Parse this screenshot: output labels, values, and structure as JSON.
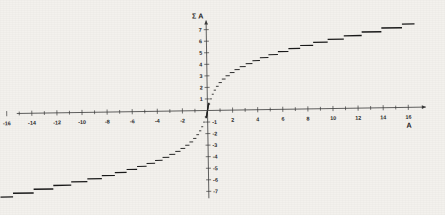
{
  "figure": {
    "background_color": "#f3f1ed",
    "axis_color": "#3a3a3a",
    "data_color": "#1a1a1a",
    "rotation_deg": -0.9
  },
  "chart_data": {
    "type": "line",
    "title": "",
    "subtitle": "",
    "xlabel": "A",
    "ylabel": "Σ A",
    "style": "dashed-step-segments",
    "grid": false,
    "legend": null,
    "xlim": [
      -17,
      17
    ],
    "ylim": [
      -7.9,
      7.9
    ],
    "xticks_major": [
      -16,
      -14,
      -12,
      -10,
      -8,
      -6,
      -4,
      -2,
      2,
      4,
      6,
      8,
      10,
      12,
      14,
      16
    ],
    "xtick_labels": [
      "-16",
      "-14",
      "-12",
      "-10",
      "-8",
      "-6",
      "-4",
      "-2",
      "2",
      "4",
      "6",
      "8",
      "10",
      "12",
      "14",
      "16"
    ],
    "xtick_step_minor": 1,
    "yticks_major": [
      7,
      6,
      5,
      4,
      3,
      2,
      1,
      -1,
      -2,
      -3,
      -4,
      -5,
      -6,
      -7
    ],
    "ytick_labels": [
      "7",
      "6",
      "5",
      "4",
      "3",
      "2",
      "1",
      "-1",
      "-2",
      "-3",
      "-4",
      "-5",
      "-6",
      "-7"
    ],
    "ytick_step_minor": 1,
    "y_axis_arrow": true,
    "x_axis_arrow": true,
    "x": [
      0.15,
      0.3,
      0.45,
      0.62,
      0.8,
      1.0,
      1.25,
      1.5,
      1.8,
      2.1,
      2.45,
      2.8,
      3.2,
      3.65,
      4.15,
      4.7,
      5.3,
      6.0,
      6.75,
      7.6,
      8.55,
      9.6,
      10.8,
      12.1,
      13.6,
      15.2,
      16.4
    ],
    "y": [
      0.6,
      1.1,
      1.5,
      1.85,
      2.15,
      2.45,
      2.75,
      3.0,
      3.3,
      3.55,
      3.8,
      4.0,
      4.25,
      4.5,
      4.7,
      4.95,
      5.2,
      5.4,
      5.65,
      5.85,
      6.1,
      6.35,
      6.6,
      6.85,
      7.1,
      7.35,
      7.5
    ],
    "segments_right": [
      {
        "x0": 0.1,
        "x1": 0.22,
        "y": 0.55
      },
      {
        "x0": 0.22,
        "x1": 0.36,
        "y": 1.0
      },
      {
        "x0": 0.36,
        "x1": 0.52,
        "y": 1.4
      },
      {
        "x0": 0.52,
        "x1": 0.7,
        "y": 1.75
      },
      {
        "x0": 0.7,
        "x1": 0.92,
        "y": 2.08
      },
      {
        "x0": 0.92,
        "x1": 1.18,
        "y": 2.4
      },
      {
        "x0": 1.18,
        "x1": 1.48,
        "y": 2.7
      },
      {
        "x0": 1.48,
        "x1": 1.82,
        "y": 2.98
      },
      {
        "x0": 1.82,
        "x1": 2.2,
        "y": 3.25
      },
      {
        "x0": 2.2,
        "x1": 2.62,
        "y": 3.5
      },
      {
        "x0": 2.62,
        "x1": 3.1,
        "y": 3.75
      },
      {
        "x0": 3.1,
        "x1": 3.64,
        "y": 4.0
      },
      {
        "x0": 3.64,
        "x1": 4.24,
        "y": 4.25
      },
      {
        "x0": 4.24,
        "x1": 4.92,
        "y": 4.5
      },
      {
        "x0": 4.92,
        "x1": 5.68,
        "y": 4.75
      },
      {
        "x0": 5.68,
        "x1": 6.52,
        "y": 5.0
      },
      {
        "x0": 6.52,
        "x1": 7.46,
        "y": 5.25
      },
      {
        "x0": 7.46,
        "x1": 8.5,
        "y": 5.5
      },
      {
        "x0": 8.5,
        "x1": 9.66,
        "y": 5.75
      },
      {
        "x0": 9.66,
        "x1": 10.95,
        "y": 6.0
      },
      {
        "x0": 10.95,
        "x1": 12.38,
        "y": 6.28
      },
      {
        "x0": 12.38,
        "x1": 13.95,
        "y": 6.58
      },
      {
        "x0": 13.95,
        "x1": 15.6,
        "y": 6.9
      },
      {
        "x0": 15.6,
        "x1": 16.6,
        "y": 7.22
      }
    ]
  },
  "axis_titles": {
    "y": "Σ A",
    "x": "A"
  }
}
